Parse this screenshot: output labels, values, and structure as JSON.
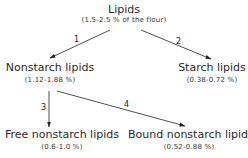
{
  "diagram": {
    "root": {
      "title": "Lipids",
      "range": "(1.5-2.5 % of the flour)"
    },
    "nonstarch": {
      "title": "Nonstarch lipids",
      "range": "(1.12-1.88 %)"
    },
    "starch": {
      "title": "Starch lipids",
      "range": "(0.38-0.72 %)"
    },
    "free": {
      "title": "Free nonstarch lipids",
      "range": "(0.6-1.0 %)"
    },
    "bound": {
      "title": "Bound nonstarch lipids",
      "range": "(0.52-0.88 %)"
    },
    "edges": [
      {
        "label": "1",
        "from": "root",
        "to": "nonstarch"
      },
      {
        "label": "2",
        "from": "root",
        "to": "starch"
      },
      {
        "label": "3",
        "from": "nonstarch",
        "to": "free"
      },
      {
        "label": "4",
        "from": "nonstarch",
        "to": "bound"
      }
    ],
    "line_color": "#222222"
  }
}
